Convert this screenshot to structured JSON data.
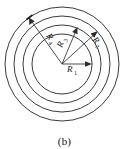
{
  "figure": {
    "caption": "(b)",
    "background_color": "#ffffff",
    "stroke_color": "#3a3a3a",
    "label_color": "#1a1a1a",
    "center": {
      "x": 62,
      "y": 64
    },
    "rings": [
      {
        "name": "inner-ring",
        "radius": 30
      },
      {
        "name": "second-ring",
        "radius": 39
      },
      {
        "name": "third-ring",
        "radius": 48
      },
      {
        "name": "outer-ring",
        "radius": 57
      }
    ],
    "radii": [
      {
        "id": "R1",
        "base": "R",
        "subscript": "1",
        "ring_radius": 30,
        "angle_deg": 0,
        "label_x": 67,
        "label_y": 72,
        "arrow_from_x": 62,
        "arrow_from_y": 64,
        "arrow_to_x": 92,
        "arrow_to_y": 64
      },
      {
        "id": "R2",
        "base": "R",
        "subscript": "2",
        "ring_radius": 48,
        "angle_deg": -42,
        "label_x": 92,
        "label_y": 40,
        "arrow_from_x": 62,
        "arrow_from_y": 64,
        "arrow_to_x": 97,
        "arrow_to_y": 32
      },
      {
        "id": "R3",
        "base": "R",
        "subscript": "3",
        "ring_radius": 39,
        "angle_deg": -68,
        "label_x": 62,
        "label_y": 48,
        "arrow_from_x": 62,
        "arrow_from_y": 64,
        "arrow_to_x": 77,
        "arrow_to_y": 28
      },
      {
        "id": "R4",
        "base": "R",
        "subscript": "4",
        "ring_radius": 57,
        "angle_deg": -125,
        "label_x": 46,
        "label_y": 36,
        "arrow_from_x": 62,
        "arrow_from_y": 64,
        "arrow_to_x": 29,
        "arrow_to_y": 18
      }
    ]
  }
}
